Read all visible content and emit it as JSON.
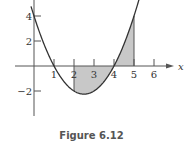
{
  "caption": "Figure 6.12",
  "colors": {
    "curve": "#333333",
    "axis": "#555555",
    "shade": "#c8c8c8"
  },
  "chart_data": {
    "type": "area",
    "title": "Figure 6.12",
    "function": "f(x) = x^2 - 5x + 4",
    "xlabel": "x",
    "ylabel": "",
    "x_ticks": [
      1,
      2,
      3,
      4,
      5,
      6
    ],
    "y_ticks": [
      4,
      2,
      -2
    ],
    "xlim": [
      0,
      6.3
    ],
    "ylim": [
      -3.9,
      5.3
    ],
    "curve_points": {
      "x": [
        0,
        0.5,
        1,
        1.5,
        2,
        2.5,
        3,
        3.5,
        4,
        4.5,
        5,
        5.25
      ],
      "y": [
        4,
        1.75,
        0,
        -1.25,
        -2,
        -2.25,
        -2,
        -1.25,
        0,
        1.75,
        4,
        5.31
      ]
    },
    "shaded_region": {
      "from_x": 2,
      "to_x": 5,
      "between": "curve and x-axis"
    },
    "grid": false,
    "legend": null
  }
}
